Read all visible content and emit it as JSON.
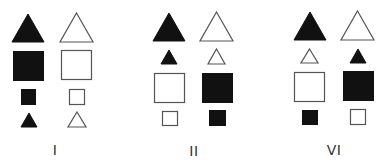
{
  "colors": {
    "filled": "#111111",
    "outline_stroke": "#555555",
    "outline_fill": "#ffffff",
    "label": "#333333"
  },
  "panels": [
    {
      "label": "I",
      "label_pos": [
        55,
        143
      ],
      "shapes": [
        {
          "kind": "triangle",
          "fill": "filled",
          "x": 12,
          "y": 14,
          "w": 32,
          "h": 28
        },
        {
          "kind": "triangle",
          "fill": "outline",
          "x": 60,
          "y": 13,
          "w": 33,
          "h": 29
        },
        {
          "kind": "square",
          "fill": "filled",
          "x": 13,
          "y": 51,
          "w": 31,
          "h": 30
        },
        {
          "kind": "square",
          "fill": "outline",
          "x": 61,
          "y": 50,
          "w": 31,
          "h": 30
        },
        {
          "kind": "square",
          "fill": "filled",
          "x": 21,
          "y": 89,
          "w": 15,
          "h": 16
        },
        {
          "kind": "square",
          "fill": "outline",
          "x": 69,
          "y": 89,
          "w": 16,
          "h": 16
        },
        {
          "kind": "triangle",
          "fill": "filled",
          "x": 21,
          "y": 113,
          "w": 16,
          "h": 14
        },
        {
          "kind": "triangle",
          "fill": "outline",
          "x": 68,
          "y": 112,
          "w": 18,
          "h": 15
        }
      ]
    },
    {
      "label": "II",
      "label_pos": [
        194,
        144
      ],
      "shapes": [
        {
          "kind": "triangle",
          "fill": "filled",
          "x": 153,
          "y": 13,
          "w": 32,
          "h": 28
        },
        {
          "kind": "triangle",
          "fill": "outline",
          "x": 200,
          "y": 12,
          "w": 33,
          "h": 29
        },
        {
          "kind": "triangle",
          "fill": "filled",
          "x": 161,
          "y": 50,
          "w": 16,
          "h": 14
        },
        {
          "kind": "triangle",
          "fill": "outline",
          "x": 208,
          "y": 49,
          "w": 17,
          "h": 15
        },
        {
          "kind": "square",
          "fill": "outline",
          "x": 154,
          "y": 73,
          "w": 31,
          "h": 30
        },
        {
          "kind": "square",
          "fill": "filled",
          "x": 202,
          "y": 73,
          "w": 31,
          "h": 30
        },
        {
          "kind": "square",
          "fill": "outline",
          "x": 162,
          "y": 111,
          "w": 16,
          "h": 15
        },
        {
          "kind": "square",
          "fill": "filled",
          "x": 209,
          "y": 110,
          "w": 17,
          "h": 16
        }
      ]
    },
    {
      "label": "VI",
      "label_pos": [
        334,
        143
      ],
      "shapes": [
        {
          "kind": "triangle",
          "fill": "filled",
          "x": 294,
          "y": 12,
          "w": 32,
          "h": 28
        },
        {
          "kind": "triangle",
          "fill": "outline",
          "x": 341,
          "y": 11,
          "w": 33,
          "h": 29
        },
        {
          "kind": "triangle",
          "fill": "outline",
          "x": 301,
          "y": 49,
          "w": 17,
          "h": 14
        },
        {
          "kind": "triangle",
          "fill": "filled",
          "x": 350,
          "y": 49,
          "w": 16,
          "h": 14
        },
        {
          "kind": "square",
          "fill": "outline",
          "x": 294,
          "y": 72,
          "w": 31,
          "h": 30
        },
        {
          "kind": "square",
          "fill": "filled",
          "x": 343,
          "y": 71,
          "w": 31,
          "h": 30
        },
        {
          "kind": "square",
          "fill": "filled",
          "x": 302,
          "y": 110,
          "w": 16,
          "h": 15
        },
        {
          "kind": "square",
          "fill": "outline",
          "x": 350,
          "y": 109,
          "w": 16,
          "h": 16
        }
      ]
    }
  ]
}
